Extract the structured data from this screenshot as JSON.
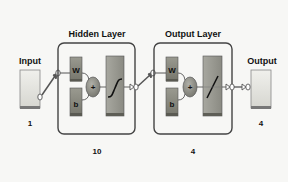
{
  "diagram": {
    "input": {
      "label": "Input",
      "size": "1"
    },
    "hidden_layer": {
      "title": "Hidden Layer",
      "neurons": "10",
      "weight_label": "W",
      "bias_label": "b",
      "sum_symbol": "+",
      "activation": "sigmoid"
    },
    "output_layer": {
      "title": "Output Layer",
      "neurons": "4",
      "weight_label": "W",
      "bias_label": "b",
      "sum_symbol": "+",
      "activation": "linear"
    },
    "output": {
      "label": "Output",
      "size": "4"
    }
  },
  "colors": {
    "background": "#f7f7f5",
    "io_box": "#e6e6e0",
    "weight_box": "#8a8a7e",
    "block_box": "#9a9a92",
    "sum_circle": "#8c8c84",
    "outline": "#444444",
    "connector": "#555555"
  }
}
